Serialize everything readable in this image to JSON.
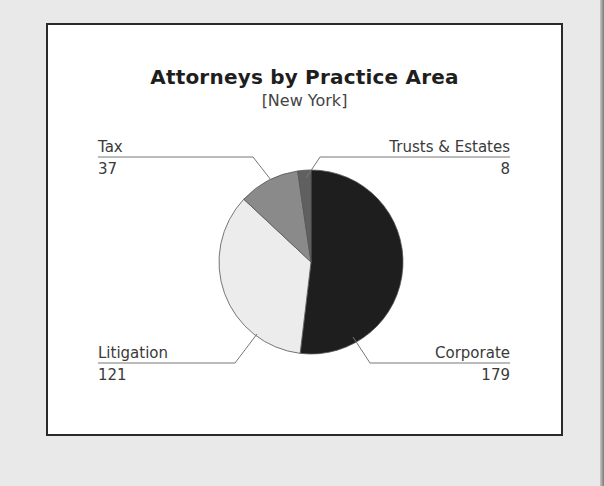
{
  "chart_data": {
    "type": "pie",
    "title": "Attorneys by Practice Area",
    "subtitle": "[New York]",
    "slices": [
      {
        "label": "Corporate",
        "value": 179,
        "color": "#1e1e1e"
      },
      {
        "label": "Litigation",
        "value": 121,
        "color": "#ececec"
      },
      {
        "label": "Tax",
        "value": 37,
        "color": "#8a8a8a"
      },
      {
        "label": "Trusts & Estates",
        "value": 8,
        "color": "#606060"
      }
    ],
    "start_angle": "12 o'clock, clockwise",
    "legend": "callout labels with leader lines"
  },
  "labels": {
    "tax": {
      "name": "Tax",
      "value": "37"
    },
    "trusts": {
      "name": "Trusts & Estates",
      "value": "8"
    },
    "litigation": {
      "name": "Litigation",
      "value": "121"
    },
    "corporate": {
      "name": "Corporate",
      "value": "179"
    }
  }
}
